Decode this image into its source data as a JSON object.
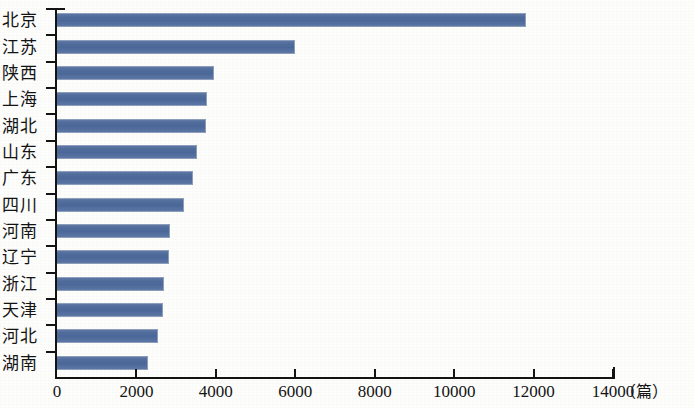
{
  "chart_data": {
    "type": "bar",
    "orientation": "horizontal",
    "title": "",
    "xlabel": "",
    "ylabel": "",
    "unit_label": "（篇）",
    "xlim": [
      0,
      14000
    ],
    "xticks": [
      0,
      2000,
      4000,
      6000,
      8000,
      10000,
      12000,
      14000
    ],
    "xtick_labels": [
      "0",
      "2000",
      "4000",
      "6000",
      "8000",
      "10000",
      "12000",
      "14000"
    ],
    "grid": false,
    "legend": false,
    "bar_color": "#54709e",
    "axis_color": "#141414",
    "categories": [
      "北京",
      "江苏",
      "陕西",
      "上海",
      "湖北",
      "山东",
      "广东",
      "四川",
      "河南",
      "辽宁",
      "浙江",
      "天津",
      "河北",
      "湖南"
    ],
    "values": [
      11800,
      6000,
      3950,
      3780,
      3760,
      3520,
      3430,
      3200,
      2840,
      2810,
      2700,
      2660,
      2540,
      2290
    ],
    "series": [
      {
        "name": "论文数量",
        "values": [
          11800,
          6000,
          3950,
          3780,
          3760,
          3520,
          3430,
          3200,
          2840,
          2810,
          2700,
          2660,
          2540,
          2290
        ]
      }
    ]
  }
}
